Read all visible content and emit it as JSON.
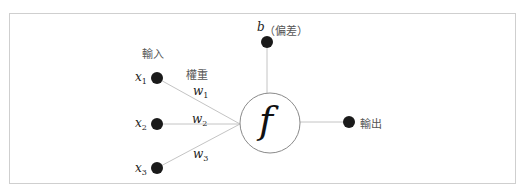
{
  "diagram": {
    "type": "perceptron / single neuron",
    "labels": {
      "input": "輸入",
      "weights": "權重",
      "bias_symbol": "b",
      "bias_text": "（偏差）",
      "output": "輸出",
      "function": "f"
    },
    "inputs": [
      {
        "var": "x",
        "sub": "1",
        "weight_var": "w",
        "weight_sub": "1"
      },
      {
        "var": "x",
        "sub": "2",
        "weight_var": "w",
        "weight_sub": "2"
      },
      {
        "var": "x",
        "sub": "3",
        "weight_var": "w",
        "weight_sub": "3"
      }
    ],
    "colors": {
      "node": "#1a1a1a",
      "line": "#bdbdbd",
      "border": "#cfcfcf",
      "text": "#555555"
    }
  }
}
